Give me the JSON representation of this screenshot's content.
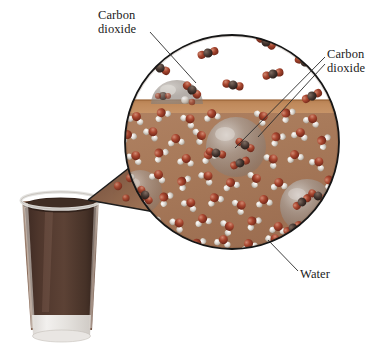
{
  "labels": {
    "carbon_dioxide_top": {
      "line1": "Carbon",
      "line2": "dioxide",
      "full": "Carbon dioxide",
      "position": "top-left"
    },
    "carbon_dioxide_right": {
      "line1": "Carbon",
      "line2": "dioxide",
      "full": "Carbon dioxide",
      "position": "right"
    },
    "water": {
      "text": "Water",
      "position": "bottom-right"
    }
  },
  "colors": {
    "gas_space": "#ffffff",
    "liquid_surface_band": "#c08a5c",
    "liquid_body": "#a87a5a",
    "circle_outline": "#161616",
    "oxygen_atom": "#9e3f30",
    "hydrogen_atom": "#e6e2dd",
    "carbon_atom": "#4a3a33",
    "bubble_fill": "#9a9490",
    "glass_liquid": "#4a332a",
    "glass_body": "#8c6a58",
    "glass_rim": "#e9e9e9",
    "leader_line": "#2a2a2a",
    "text": "#1b1b1b"
  },
  "magnifier": {
    "center_x": 232,
    "center_y": 142,
    "radius": 107,
    "surface_y": 100,
    "surface_band_height": 14
  },
  "glass": {
    "name": "drinking-glass",
    "contents": "carbonated beverage",
    "top_x": 18,
    "top_y": 196,
    "width": 85,
    "height": 145
  },
  "molecules": {
    "carbon_dioxide_gas": [
      {
        "x": 160,
        "y": 68,
        "r": 24
      },
      {
        "x": 207,
        "y": 53,
        "r": -18
      },
      {
        "x": 232,
        "y": 84,
        "r": 12
      },
      {
        "x": 265,
        "y": 40,
        "r": 30
      },
      {
        "x": 272,
        "y": 73,
        "r": -12
      },
      {
        "x": 305,
        "y": 63,
        "r": 20
      },
      {
        "x": 311,
        "y": 96,
        "r": -25
      },
      {
        "x": 186,
        "y": 90,
        "r": 40
      }
    ],
    "carbon_dioxide_dissolved": [
      {
        "x": 245,
        "y": 145,
        "r": 30
      },
      {
        "x": 239,
        "y": 161,
        "r": -20
      },
      {
        "x": 213,
        "y": 154,
        "r": 15
      },
      {
        "x": 300,
        "y": 204,
        "r": -35
      },
      {
        "x": 318,
        "y": 196,
        "r": 25
      },
      {
        "x": 170,
        "y": 92,
        "r": -10
      },
      {
        "x": 196,
        "y": 197,
        "r": 18
      },
      {
        "x": 289,
        "y": 226,
        "r": -28
      }
    ],
    "bubbles": [
      {
        "x": 177,
        "y": 97,
        "r": 26,
        "type": "surface-dome"
      },
      {
        "x": 236,
        "y": 147,
        "r": 30,
        "type": "submerged"
      },
      {
        "x": 306,
        "y": 205,
        "r": 27,
        "type": "submerged"
      },
      {
        "x": 143,
        "y": 190,
        "r": 22,
        "type": "submerged"
      }
    ]
  }
}
